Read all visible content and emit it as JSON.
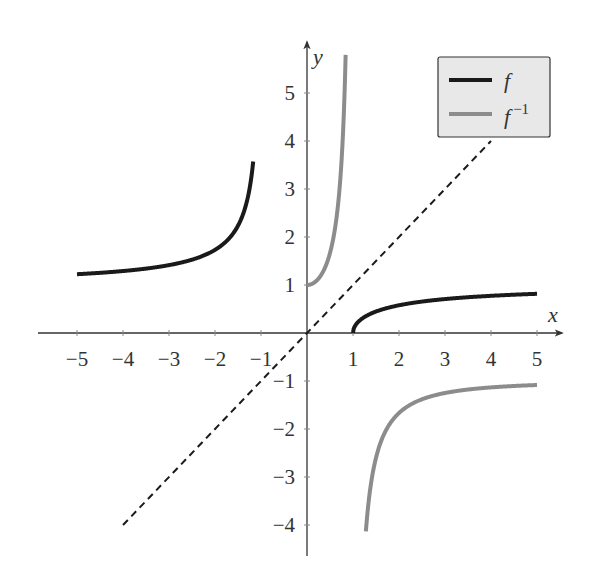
{
  "chart_data": {
    "type": "line",
    "title": "",
    "xlabel": "x",
    "ylabel": "y",
    "xlim": [
      -5.6,
      5.6
    ],
    "ylim": [
      -4.8,
      5.6
    ],
    "grid": false,
    "legend_position": "upper right",
    "x_ticks": [
      -5,
      -4,
      -3,
      -2,
      -1,
      1,
      2,
      3,
      4,
      5
    ],
    "x_tick_labels": [
      "−5",
      "−4",
      "−3",
      "−2",
      "−1",
      "1",
      "2",
      "3",
      "4",
      "5"
    ],
    "y_ticks": [
      -4,
      -3,
      -2,
      -1,
      1,
      2,
      3,
      4,
      5
    ],
    "y_tick_labels": [
      "−4",
      "−3",
      "−2",
      "−1",
      "1",
      "2",
      "3",
      "4",
      "5"
    ],
    "series": [
      {
        "name": "f",
        "legend_label": "f",
        "color": "#1a1a1a",
        "formula": "sqrt((x-1)/(x+1))",
        "branches": [
          {
            "x": [
              -5,
              -4,
              -3,
              -2,
              -1.5,
              -1.3,
              -1.2,
              -1.17
            ],
            "y": [
              1.22,
              1.29,
              1.41,
              1.73,
              2.24,
              2.88,
              3.32,
              3.56
            ]
          },
          {
            "x": [
              1,
              1.5,
              2,
              3,
              4,
              5
            ],
            "y": [
              0,
              0.45,
              0.58,
              0.71,
              0.77,
              0.82
            ]
          }
        ]
      },
      {
        "name": "f^-1",
        "legend_label": "f",
        "legend_sup": "−1",
        "color": "#8c8c8c",
        "formula": "(1+x^2)/(1-x^2)",
        "branches": [
          {
            "x": [
              0,
              0.3,
              0.5,
              0.7,
              0.8,
              0.84
            ],
            "y": [
              1,
              1.2,
              1.67,
              2.92,
              4.56,
              5.37
            ]
          },
          {
            "x": [
              1.28,
              1.5,
              2,
              3,
              4,
              5
            ],
            "y": [
              -4.05,
              -2.6,
              -1.67,
              -1.25,
              -1.13,
              -1.08
            ]
          }
        ]
      },
      {
        "name": "y = x",
        "color": "#1a1a1a",
        "style": "dashed",
        "x": [
          -4,
          4
        ],
        "y": [
          -4,
          4
        ]
      }
    ]
  }
}
